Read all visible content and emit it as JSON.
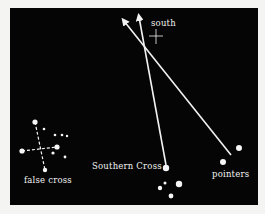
{
  "diagram": {
    "background": "#050505",
    "foreground": "#f2f2f2",
    "labels": {
      "south": "south",
      "southern_cross": "Southern Cross",
      "pointers": "pointers",
      "false_cross": "false cross"
    },
    "south_marker": {
      "x": 156,
      "y": 36
    },
    "arrows": [
      {
        "name": "southern-cross-axis",
        "from": [
          166,
          165
        ],
        "to": [
          139,
          15
        ]
      },
      {
        "name": "pointers-bisector",
        "from": [
          231,
          155
        ],
        "to": [
          123,
          19
        ]
      }
    ],
    "stars": {
      "southern_cross": [
        [
          166,
          168,
          3.2
        ],
        [
          179,
          184,
          3.2
        ],
        [
          160,
          188,
          2.2
        ],
        [
          165,
          183,
          1.5
        ],
        [
          171,
          196,
          2.4
        ]
      ],
      "pointers": [
        [
          239,
          148,
          3.0
        ],
        [
          223,
          162,
          3.0
        ]
      ],
      "false_cross": [
        [
          35,
          122,
          2.6
        ],
        [
          22,
          151,
          2.6
        ],
        [
          57,
          147,
          2.6
        ],
        [
          45,
          170,
          2.2
        ],
        [
          44,
          129,
          1.3
        ],
        [
          55,
          135,
          1.3
        ],
        [
          62,
          135,
          1.3
        ],
        [
          67,
          136,
          1.2
        ],
        [
          53,
          153,
          1.6
        ],
        [
          65,
          157,
          1.4
        ]
      ]
    }
  }
}
